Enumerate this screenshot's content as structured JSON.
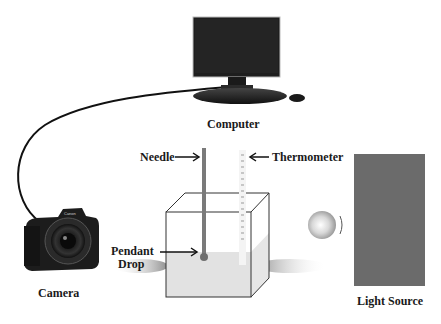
{
  "diagram": {
    "components": {
      "computer": {
        "label": "Computer"
      },
      "camera": {
        "label": "Camera",
        "brand_text": "Canon"
      },
      "needle": {
        "label": "Needle"
      },
      "thermometer": {
        "label": "Thermometer"
      },
      "pendant_drop": {
        "label_line1": "Pendant",
        "label_line2": "Drop"
      },
      "light_source": {
        "label": "Light Source"
      }
    },
    "colors": {
      "monitor": "#1e1e1e",
      "needle": "#7a7a7a",
      "liquid": "#e6e6e6",
      "light_source": "#6b6b6b",
      "shadow": "#9a9a9a",
      "text": "#1a1a1a"
    }
  }
}
